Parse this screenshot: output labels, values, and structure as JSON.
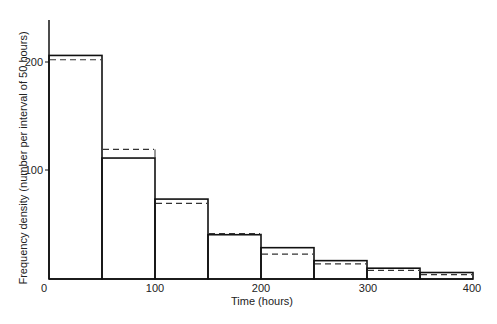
{
  "chart_data": {
    "type": "bar",
    "title": "",
    "xlabel": "Time (hours)",
    "ylabel": "Frequency density (number per interval of 50 hours)",
    "xlim": [
      0,
      400
    ],
    "ylim": [
      0,
      240
    ],
    "grid": false,
    "x_ticks": [
      "0",
      "100",
      "200",
      "300",
      "400"
    ],
    "y_ticks": [
      "100",
      "200"
    ],
    "bin_edges": [
      0,
      50,
      100,
      150,
      200,
      250,
      300,
      350,
      400
    ],
    "series": [
      {
        "name": "observed (solid histogram)",
        "style": "solid",
        "values": [
          207,
          112,
          74,
          41,
          29,
          17,
          10,
          6
        ]
      },
      {
        "name": "fitted (dashed)",
        "style": "dashed",
        "values": [
          203,
          120,
          70,
          42,
          23,
          14,
          8,
          4
        ]
      }
    ]
  }
}
